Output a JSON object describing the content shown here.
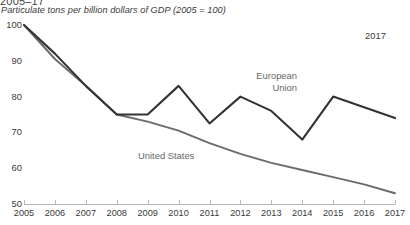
{
  "header": {
    "clipped_title": "2005–17",
    "subtitle": "Particulate tons per billion dollars of GDP (2005 = 100)"
  },
  "annotations": {
    "top_right_year": "2017"
  },
  "labels": {
    "european_union_line1": "European",
    "european_union_line2": "Union",
    "united_states": "United States"
  },
  "colors": {
    "european_union": "#333333",
    "united_states": "#6b6b6b",
    "axis": "#b8b8b8",
    "text": "#3a3a3a",
    "label_text": "#666666"
  },
  "chart_data": {
    "type": "line",
    "title": "2005–17",
    "subtitle": "Particulate tons per billion dollars of GDP (2005 = 100)",
    "xlabel": "",
    "ylabel": "",
    "grid": false,
    "legend_position": "inline-labels",
    "categories": [
      "2005",
      "2006",
      "2007",
      "2008",
      "2009",
      "2010",
      "2011",
      "2012",
      "2013",
      "2014",
      "2015",
      "2016",
      "2017"
    ],
    "x": [
      2005,
      2006,
      2007,
      2008,
      2009,
      2010,
      2011,
      2012,
      2013,
      2014,
      2015,
      2016,
      2017
    ],
    "ylim": [
      50,
      100
    ],
    "yticks": [
      50,
      60,
      70,
      80,
      90,
      100
    ],
    "series": [
      {
        "name": "European Union",
        "color": "#333333",
        "values": [
          100,
          92,
          83,
          75,
          75,
          83,
          72.5,
          80,
          76,
          68,
          80,
          77,
          74
        ]
      },
      {
        "name": "United States",
        "color": "#6b6b6b",
        "values": [
          100,
          90.5,
          83,
          75,
          73,
          70.5,
          67,
          64,
          61.5,
          59.5,
          57.5,
          55.5,
          53
        ]
      }
    ]
  }
}
